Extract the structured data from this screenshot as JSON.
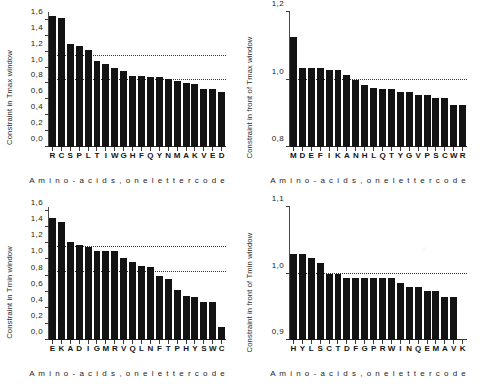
{
  "figure": {
    "decimal_separator": ",",
    "bar_color": "#131313",
    "axis_color": "#333333",
    "background": "#ffffff"
  },
  "panels": [
    {
      "id": "top-left",
      "ylabel": "Constraint in Tmax window",
      "xlabel": "A m i n o - a c i d s ,  o n e  l e t t e r  c o d e",
      "yticklabels": [
        "0,0",
        "0,2",
        "0,4",
        "0,6",
        "0,8",
        "1,0",
        "1,2",
        "1,4",
        "1,6"
      ]
    },
    {
      "id": "top-right",
      "ylabel": "Constraint in front of Tmax window",
      "xlabel": "A m i n o - a c i d s ,  o n e  l e t t e r  c o d e",
      "yticklabels": [
        "0,8",
        "1,0",
        "1,2"
      ]
    },
    {
      "id": "bottom-left",
      "ylabel": "Constraint in Tmin window",
      "xlabel": "A m i n o - a c i d s ,  o n e  l e t t e r  c o d e",
      "yticklabels": [
        "0,0",
        "0,2",
        "0,4",
        "0,6",
        "0,8",
        "1,0",
        "1,2",
        "1,4",
        "1,6"
      ]
    },
    {
      "id": "bottom-right",
      "ylabel": "Constraint in front of Tmin window",
      "xlabel": "A m i n o - a c i d s ,  o n e  l e t t e r  c o d e",
      "yticklabels": [
        "0,9",
        "1,0",
        "1,1"
      ]
    }
  ],
  "chart_data": [
    {
      "type": "bar",
      "id": "top-left",
      "title": "",
      "xlabel": "Amino-acids, one letter code",
      "ylabel": "Constraint in Tmax window",
      "ylim": [
        0.0,
        1.7
      ],
      "yticks": [
        0.0,
        0.2,
        0.4,
        0.6,
        0.8,
        1.0,
        1.2,
        1.4,
        1.6
      ],
      "grid": false,
      "reference_lines": [
        1.15,
        0.85
      ],
      "reference_line_style": "dotted",
      "categories": [
        "R",
        "C",
        "S",
        "P",
        "L",
        "T",
        "I",
        "W",
        "G",
        "H",
        "F",
        "Q",
        "Y",
        "N",
        "M",
        "A",
        "K",
        "V",
        "E",
        "D"
      ],
      "values": [
        1.65,
        1.62,
        1.3,
        1.27,
        1.22,
        1.08,
        1.04,
        1.0,
        0.96,
        0.9,
        0.89,
        0.88,
        0.88,
        0.86,
        0.83,
        0.8,
        0.79,
        0.73,
        0.73,
        0.69
      ]
    },
    {
      "type": "bar",
      "id": "top-right",
      "title": "",
      "xlabel": "Amino-acids, one letter code",
      "ylabel": "Constraint in front of Tmax window",
      "ylim": [
        0.8,
        1.2
      ],
      "yticks": [
        0.8,
        1.0,
        1.2
      ],
      "grid": false,
      "reference_lines": [
        1.0
      ],
      "reference_line_style": "dotted",
      "categories": [
        "M",
        "D",
        "E",
        "F",
        "I",
        "K",
        "A",
        "N",
        "H",
        "L",
        "Q",
        "T",
        "Y",
        "G",
        "V",
        "P",
        "S",
        "C",
        "W",
        "R"
      ],
      "values": [
        1.125,
        1.035,
        1.035,
        1.035,
        1.028,
        1.028,
        1.012,
        1.0,
        0.985,
        0.975,
        0.973,
        0.973,
        0.963,
        0.963,
        0.955,
        0.955,
        0.945,
        0.945,
        0.925,
        0.925
      ]
    },
    {
      "type": "bar",
      "id": "bottom-left",
      "title": "",
      "xlabel": "Amino-acids, one letter code",
      "ylabel": "Constraint in Tmin window",
      "ylim": [
        0.0,
        1.65
      ],
      "yticks": [
        0.0,
        0.2,
        0.4,
        0.6,
        0.8,
        1.0,
        1.2,
        1.4,
        1.6
      ],
      "grid": false,
      "reference_lines": [
        1.15,
        0.85
      ],
      "reference_line_style": "dotted",
      "categories": [
        "E",
        "K",
        "A",
        "D",
        "I",
        "G",
        "M",
        "R",
        "V",
        "Q",
        "L",
        "N",
        "F",
        "T",
        "P",
        "H",
        "Y",
        "S",
        "W",
        "C"
      ],
      "values": [
        1.51,
        1.47,
        1.21,
        1.18,
        1.15,
        1.11,
        1.1,
        1.1,
        1.02,
        0.97,
        0.92,
        0.9,
        0.79,
        0.76,
        0.62,
        0.55,
        0.53,
        0.47,
        0.47,
        0.16
      ]
    },
    {
      "type": "bar",
      "id": "bottom-right",
      "title": "",
      "xlabel": "Amino-acids, one letter code",
      "ylabel": "Constraint in front of Tmin window",
      "ylim": [
        0.9,
        1.1
      ],
      "yticks": [
        0.9,
        1.0,
        1.1
      ],
      "grid": false,
      "reference_lines": [
        1.0
      ],
      "reference_line_style": "dotted",
      "categories": [
        "H",
        "Y",
        "L",
        "S",
        "C",
        "T",
        "D",
        "F",
        "G",
        "P",
        "R",
        "W",
        "I",
        "N",
        "Q",
        "E",
        "M",
        "A",
        "V",
        "K"
      ],
      "values": [
        1.03,
        1.03,
        1.024,
        1.016,
        1.0,
        1.0,
        0.993,
        0.993,
        0.993,
        0.993,
        0.993,
        0.993,
        0.986,
        0.98,
        0.98,
        0.974,
        0.974,
        0.965,
        0.965,
        0.9
      ]
    }
  ]
}
